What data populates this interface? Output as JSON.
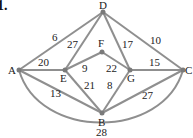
{
  "problem_number": "1.",
  "nodes": [
    {
      "id": "D",
      "x": 103,
      "y": 12,
      "lx": 99,
      "ly": 9
    },
    {
      "id": "A",
      "x": 19,
      "y": 70,
      "lx": 8,
      "ly": 74
    },
    {
      "id": "E",
      "x": 65,
      "y": 70,
      "lx": 60,
      "ly": 82
    },
    {
      "id": "F",
      "x": 102,
      "y": 52,
      "lx": 98,
      "ly": 47
    },
    {
      "id": "G",
      "x": 130,
      "y": 70,
      "lx": 127,
      "ly": 82
    },
    {
      "id": "C",
      "x": 183,
      "y": 70,
      "lx": 185,
      "ly": 74
    },
    {
      "id": "B",
      "x": 102,
      "y": 113,
      "lx": 98,
      "ly": 126
    }
  ],
  "edges": [
    {
      "from": "A",
      "to": "D",
      "weight": "6",
      "lx": 52,
      "ly": 41
    },
    {
      "from": "D",
      "to": "E",
      "weight": "27",
      "lx": 67,
      "ly": 48
    },
    {
      "from": "D",
      "to": "G",
      "weight": "17",
      "lx": 122,
      "ly": 48
    },
    {
      "from": "D",
      "to": "C",
      "weight": "10",
      "lx": 150,
      "ly": 44
    },
    {
      "from": "A",
      "to": "E",
      "weight": "20",
      "lx": 38,
      "ly": 66
    },
    {
      "from": "E",
      "to": "F",
      "weight": "9",
      "lx": 82,
      "ly": 72
    },
    {
      "from": "F",
      "to": "G",
      "weight": "22",
      "lx": 106,
      "ly": 72
    },
    {
      "from": "G",
      "to": "C",
      "weight": "15",
      "lx": 149,
      "ly": 66
    },
    {
      "from": "E",
      "to": "B",
      "weight": "21",
      "lx": 84,
      "ly": 89
    },
    {
      "from": "G",
      "to": "B",
      "weight": "8",
      "lx": 107,
      "ly": 89
    },
    {
      "from": "A",
      "to": "B",
      "weight": "13",
      "lx": 50,
      "ly": 97
    },
    {
      "from": "B",
      "to": "C",
      "weight": "27",
      "lx": 142,
      "ly": 99
    },
    {
      "from": "A",
      "to": "C",
      "weight": "28",
      "lx": 96,
      "ly": 136,
      "curve": true
    }
  ]
}
